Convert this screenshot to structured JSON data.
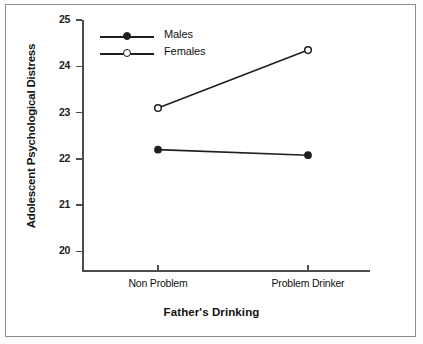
{
  "chart_data": {
    "type": "line",
    "title": "",
    "xlabel": "Father's Drinking",
    "ylabel": "Adolescent Psychological Distress",
    "categories": [
      "Non Problem",
      "Problem Drinker"
    ],
    "series": [
      {
        "name": "Males",
        "values": [
          22.2,
          22.08
        ],
        "marker": "filled-circle"
      },
      {
        "name": "Females",
        "values": [
          23.1,
          24.35
        ],
        "marker": "open-circle"
      }
    ],
    "ylim": [
      19.6,
      25
    ],
    "yticks": [
      25,
      24,
      23,
      22,
      21,
      20
    ],
    "ytick_labels": [
      "25",
      "24",
      "23",
      "22",
      "21",
      "20"
    ],
    "grid": false,
    "legend_position": "top-left",
    "line_color": "#1f1f1f"
  },
  "legend": {
    "items": [
      {
        "label": "Males",
        "marker": "filled-circle"
      },
      {
        "label": "Females",
        "marker": "open-circle"
      }
    ]
  },
  "axes": {
    "y_title": "Adolescent Psychological Distress",
    "x_title": "Father's Drinking",
    "y_tick_labels": [
      "25",
      "24",
      "23",
      "22",
      "21",
      "20"
    ],
    "x_tick_labels": [
      "Non Problem",
      "Problem Drinker"
    ]
  }
}
